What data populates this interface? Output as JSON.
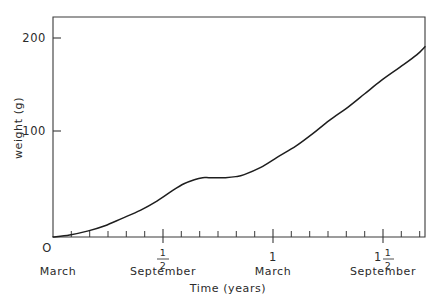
{
  "chart_data": {
    "type": "line",
    "title": "",
    "xlabel": "Time (years)",
    "ylabel": "weight (g)",
    "xlim": [
      0,
      1.79
    ],
    "ylim": [
      0,
      215
    ],
    "grid": false,
    "legend": null,
    "y_ticks": [
      {
        "value": 100,
        "label": "100"
      },
      {
        "value": 200,
        "label": "200"
      }
    ],
    "y_origin_label": "O",
    "x_ticks": [
      {
        "value": 0,
        "label_top": "O",
        "label_whole": "",
        "label_num": "",
        "label_den": "",
        "month": "March"
      },
      {
        "value": 0.5,
        "label_top": "",
        "label_whole": "",
        "label_num": "1",
        "label_den": "2",
        "month": "September"
      },
      {
        "value": 1.0,
        "label_top": "",
        "label_whole": "1",
        "label_num": "",
        "label_den": "",
        "month": "March"
      },
      {
        "value": 1.5,
        "label_top": "",
        "label_whole": "1",
        "label_num": "1",
        "label_den": "2",
        "month": "September"
      }
    ],
    "x_minor_tick_interval": 0.0833,
    "series": [
      {
        "name": "weight",
        "color": "#1e1e1e",
        "x": [
          0.0,
          0.08,
          0.17,
          0.25,
          0.33,
          0.42,
          0.5,
          0.58,
          0.63,
          0.68,
          0.72,
          0.75,
          0.79,
          0.83,
          0.88,
          0.92,
          1.0,
          1.08,
          1.17,
          1.25,
          1.33,
          1.42,
          1.5,
          1.58,
          1.67,
          1.75,
          1.79
        ],
        "y": [
          0,
          2,
          6,
          11,
          18,
          26,
          35,
          46,
          52,
          56,
          58,
          58,
          58,
          58,
          59,
          61,
          68,
          78,
          89,
          101,
          114,
          127,
          140,
          153,
          166,
          178,
          186
        ]
      }
    ]
  },
  "axes": {
    "y_axis_label": "weight (g)",
    "x_axis_label": "Time (years)"
  }
}
